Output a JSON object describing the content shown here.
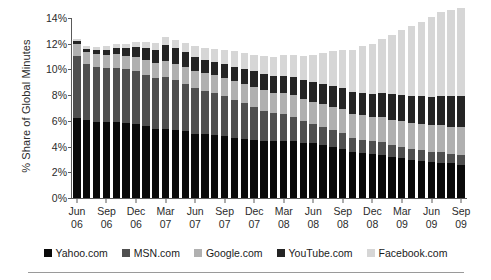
{
  "chart_data": {
    "type": "bar",
    "stacked": true,
    "title": "",
    "xlabel": "",
    "ylabel": "% Share of Global Minutes",
    "ylim": [
      0,
      14
    ],
    "ytick_labels": [
      "0%",
      "2%",
      "4%",
      "6%",
      "8%",
      "10%",
      "12%",
      "14%"
    ],
    "ytick_values": [
      0,
      2,
      4,
      6,
      8,
      10,
      12,
      14
    ],
    "grid": false,
    "legend_position": "bottom",
    "categories": [
      "Jun 06",
      "Jul 06",
      "Aug 06",
      "Sep 06",
      "Oct 06",
      "Nov 06",
      "Dec 06",
      "Jan 07",
      "Feb 07",
      "Mar 07",
      "Apr 07",
      "May 07",
      "Jun 07",
      "Jul 07",
      "Aug 07",
      "Sep 07",
      "Oct 07",
      "Nov 07",
      "Dec 07",
      "Jan 08",
      "Feb 08",
      "Mar 08",
      "Apr 08",
      "May 08",
      "Jun 08",
      "Jul 08",
      "Aug 08",
      "Sep 08",
      "Oct 08",
      "Nov 08",
      "Dec 08",
      "Jan 09",
      "Feb 09",
      "Mar 09",
      "Apr 09",
      "May 09",
      "Jun 09",
      "Jul 09",
      "Aug 09",
      "Sep 09"
    ],
    "xtick_labels": [
      {
        "month": "Jun",
        "year": "06",
        "index": 0
      },
      {
        "month": "Sep",
        "year": "06",
        "index": 3
      },
      {
        "month": "Dec",
        "year": "06",
        "index": 6
      },
      {
        "month": "Mar",
        "year": "07",
        "index": 9
      },
      {
        "month": "Jun",
        "year": "07",
        "index": 12
      },
      {
        "month": "Sep",
        "year": "07",
        "index": 15
      },
      {
        "month": "Dec",
        "year": "07",
        "index": 18
      },
      {
        "month": "Mar",
        "year": "08",
        "index": 21
      },
      {
        "month": "Jun",
        "year": "08",
        "index": 24
      },
      {
        "month": "Sep",
        "year": "08",
        "index": 27
      },
      {
        "month": "Dec",
        "year": "08",
        "index": 30
      },
      {
        "month": "Mar",
        "year": "09",
        "index": 33
      },
      {
        "month": "Jun",
        "year": "09",
        "index": 36
      },
      {
        "month": "Sep",
        "year": "09",
        "index": 39
      }
    ],
    "series": [
      {
        "name": "Yahoo.com",
        "color": "#0a0a0a",
        "values": [
          6.2,
          6.1,
          5.95,
          5.95,
          5.9,
          5.8,
          5.75,
          5.6,
          5.35,
          5.4,
          5.3,
          5.2,
          5.0,
          4.95,
          4.9,
          4.8,
          4.7,
          4.6,
          4.5,
          4.45,
          4.4,
          4.45,
          4.4,
          4.3,
          4.25,
          4.15,
          4.0,
          3.85,
          3.6,
          3.5,
          3.4,
          3.35,
          3.2,
          3.1,
          2.95,
          2.85,
          2.8,
          2.75,
          2.7,
          2.6
        ]
      },
      {
        "name": "MSN.com",
        "color": "#4f4f4f",
        "values": [
          4.85,
          4.3,
          4.25,
          4.2,
          4.25,
          4.2,
          4.15,
          4.0,
          3.95,
          4.0,
          3.9,
          3.7,
          3.55,
          3.4,
          3.3,
          3.1,
          2.9,
          2.8,
          2.6,
          2.35,
          2.2,
          2.05,
          1.9,
          1.7,
          1.5,
          1.4,
          1.3,
          1.2,
          1.1,
          1.05,
          1.0,
          1.0,
          0.95,
          0.9,
          0.9,
          0.85,
          0.8,
          0.8,
          0.75,
          0.75
        ]
      },
      {
        "name": "Google.com",
        "color": "#b0b0b0",
        "values": [
          0.95,
          0.95,
          1.0,
          1.0,
          1.05,
          1.05,
          1.1,
          1.15,
          1.2,
          1.25,
          1.25,
          1.3,
          1.35,
          1.35,
          1.4,
          1.45,
          1.5,
          1.5,
          1.55,
          1.6,
          1.6,
          1.65,
          1.7,
          1.7,
          1.75,
          1.8,
          1.8,
          1.85,
          1.85,
          1.9,
          1.9,
          1.95,
          1.95,
          2.0,
          2.0,
          2.05,
          2.05,
          2.1,
          2.1,
          2.15
        ]
      },
      {
        "name": "YouTube.com",
        "color": "#242424",
        "values": [
          0.2,
          0.25,
          0.3,
          0.4,
          0.5,
          0.6,
          0.75,
          0.9,
          1.05,
          1.25,
          1.2,
          1.15,
          1.1,
          1.05,
          1.0,
          1.05,
          1.1,
          1.15,
          1.2,
          1.25,
          1.3,
          1.35,
          1.4,
          1.45,
          1.5,
          1.55,
          1.6,
          1.65,
          1.7,
          1.75,
          1.8,
          1.9,
          2.0,
          2.05,
          2.1,
          2.15,
          2.2,
          2.3,
          2.35,
          2.4
        ]
      },
      {
        "name": "Facebook.com",
        "color": "#d6d6d6",
        "values": [
          0.15,
          0.2,
          0.22,
          0.25,
          0.3,
          0.35,
          0.4,
          0.45,
          0.5,
          0.6,
          0.65,
          0.7,
          0.8,
          0.9,
          1.0,
          1.1,
          1.2,
          1.25,
          1.3,
          1.4,
          1.5,
          1.6,
          1.75,
          1.9,
          2.1,
          2.4,
          2.7,
          3.0,
          3.3,
          3.6,
          3.9,
          4.2,
          4.6,
          5.0,
          5.4,
          5.8,
          6.2,
          6.5,
          6.7,
          6.9
        ]
      }
    ]
  }
}
